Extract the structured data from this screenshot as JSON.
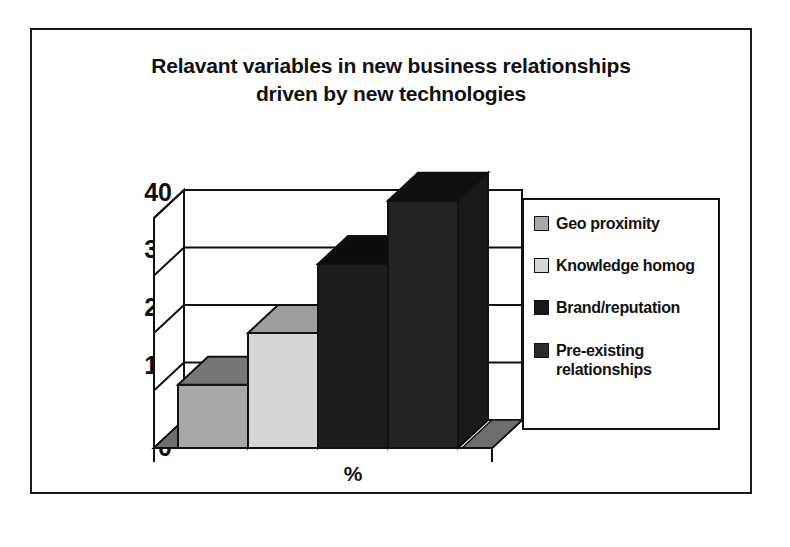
{
  "figure": {
    "frame_border_color": "#1a1a1a",
    "background": "#ffffff"
  },
  "chart_data": {
    "type": "bar",
    "title_line1": "Relavant variables in new business relationships",
    "title_line2": "driven by new technologies",
    "title": "Relavant variables in new business relationships driven by new technologies",
    "xlabel": "%",
    "ylabel": "",
    "categories": [
      "Geo proximity",
      "Knowledge homog",
      "Brand/reputation",
      "Pre-existing relationships"
    ],
    "values": [
      11,
      20,
      32,
      43
    ],
    "ylim": [
      0,
      40
    ],
    "yticks": [
      0,
      10,
      20,
      30,
      40
    ],
    "ytick_labels": [
      "0",
      "10",
      "20",
      "30",
      "40"
    ],
    "grid": true,
    "legend_position": "right",
    "style": "3d-column",
    "series_colors": [
      "#a8a8a8",
      "#d6d6d6",
      "#181818",
      "#2b2b2b"
    ],
    "series": [
      {
        "name": "Geo proximity",
        "value": 11,
        "color": "#a8a8a8"
      },
      {
        "name": "Knowledge homog",
        "value": 20,
        "color": "#d6d6d6"
      },
      {
        "name": "Brand/reputation",
        "value": 32,
        "color": "#181818"
      },
      {
        "name": "Pre-existing relationships",
        "value": 43,
        "color": "#2b2b2b"
      }
    ]
  },
  "axis": {
    "ticks": [
      {
        "label": "40",
        "value": 40
      },
      {
        "label": "30",
        "value": 30
      },
      {
        "label": "20",
        "value": 20
      },
      {
        "label": "10",
        "value": 10
      },
      {
        "label": "0",
        "value": 0
      }
    ],
    "x_title": "%"
  },
  "legend": {
    "items": [
      {
        "label": "Geo proximity",
        "color": "#a8a8a8"
      },
      {
        "label": "Knowledge homog",
        "color": "#d6d6d6"
      },
      {
        "label": "Brand/reputation",
        "color": "#181818"
      },
      {
        "label": "Pre-existing relationships",
        "color": "#2b2b2b"
      }
    ]
  }
}
